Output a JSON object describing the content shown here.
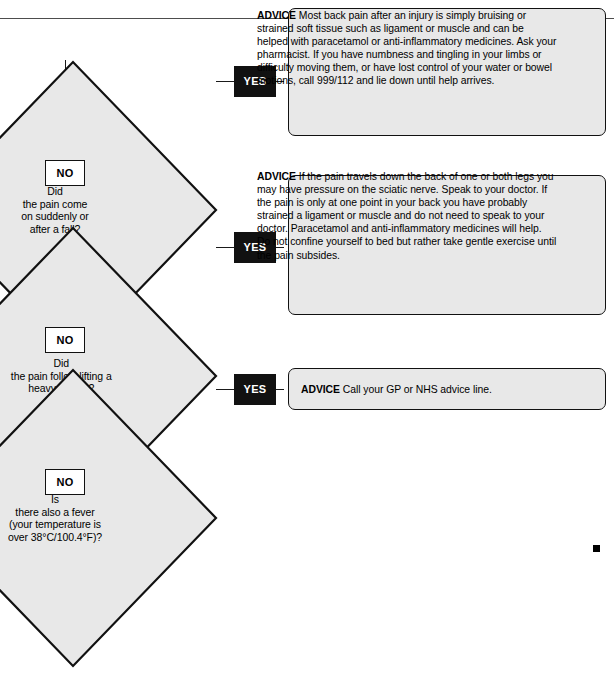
{
  "chart": {
    "orientation": "rotated-90-clockwise",
    "colors": {
      "node_fill": "#e8e8e8",
      "stroke": "#111111",
      "yes_tag_bg": "#111111",
      "yes_tag_text": "#ffffff",
      "no_tag_bg": "#ffffff",
      "no_tag_text": "#000000",
      "spine": "#4d4d4d"
    }
  },
  "decisions": [
    {
      "id": "d1",
      "label": "Did\nthe pain come\non suddenly or\nafter a fall?",
      "yes_tag": "YES",
      "no_tag": "NO"
    },
    {
      "id": "d2",
      "label": "Did\nthe pain follow lifting a\nheavy weight?",
      "yes_tag": "YES",
      "no_tag": "NO"
    },
    {
      "id": "d3",
      "label": "Is\nthere also a fever\n(your temperature is\nover 38°C/100.4°F)?",
      "yes_tag": "YES",
      "no_tag": "NO"
    }
  ],
  "advice_boxes": [
    {
      "id": "a1",
      "prefix": "ADVICE",
      "body": " Most back pain after an injury is simply bruising or strained soft tissue such as ligament or muscle and can be helped with paracetamol or anti-inflammatory medicines. Ask your pharmacist. If you have numbness and tingling in your limbs or difficulty moving them, or have lost control of your water or bowel motions, call 999/112 and lie down until help arrives."
    },
    {
      "id": "a2",
      "prefix": "ADVICE",
      "body": " If the pain travels down the back of one or both legs you may have pressure on the sciatic nerve. Speak to your doctor. If the pain is only at one point in your back you have probably strained a ligament or muscle and do not need to speak to your doctor. Paracetamol and anti-inflammatory medicines will help. Do not confine yourself to bed but rather take gentle exercise until the pain subsides."
    },
    {
      "id": "a3",
      "prefix": "ADVICE",
      "body": " Call your GP or NHS advice line."
    }
  ],
  "flow": {
    "start_marker": "start-dot",
    "end_marker": "arrow-right"
  }
}
